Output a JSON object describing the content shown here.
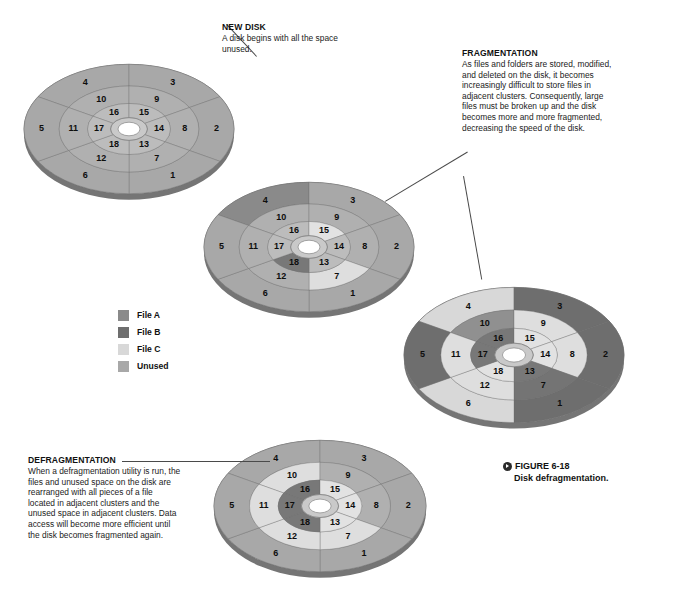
{
  "figure": {
    "caption_label": "FIGURE 6-18",
    "caption_title": "Disk defragmentation.",
    "caption_icon": "play-circle-icon"
  },
  "annotations": [
    {
      "id": "new-disk",
      "heading": "NEW DISK",
      "body": "A disk begins with all the space unused."
    },
    {
      "id": "fragmentation",
      "heading": "FRAGMENTATION",
      "body": "As files and folders are stored, modified, and deleted on the disk, it becomes increasingly difficult to store files in adjacent clusters. Consequently, large files must be broken up and the disk becomes more and more fragmented, decreasing the speed of the disk."
    },
    {
      "id": "defragmentation",
      "heading": "DEFRAGMENTATION",
      "body": "When a defragmentation utility is run, the files and unused space on the disk are rearranged with all pieces of a file located in adjacent clusters and the unused space in adjacent clusters. Data access will become more efficient until the disk becomes fragmented again."
    }
  ],
  "legend": {
    "items": [
      {
        "label": "File A",
        "color": "#8a8a8a"
      },
      {
        "label": "File B",
        "color": "#6e6e6e"
      },
      {
        "label": "File C",
        "color": "#d8d8d8"
      },
      {
        "label": "Unused",
        "color": "#a8a8a8"
      }
    ]
  },
  "colors": {
    "file_a": "#8a8a8a",
    "file_b": "#6e6e6e",
    "file_c": "#d8d8d8",
    "unused": "#a8a8a8",
    "unused_mid": "#b0b0b0",
    "unused_light": "#bcbcbc",
    "edge": "#9a9a9a",
    "rim": "#8f8f8f",
    "hub_outer": "#c9c9c9",
    "hub_inner": "#ffffff",
    "divider": "#6d6d6d",
    "leader": "#4a4a4a"
  },
  "disk_geometry": {
    "sector_count": 6,
    "ring_count": 3,
    "cluster_numbers": [
      1,
      2,
      3,
      4,
      5,
      6,
      7,
      8,
      9,
      10,
      11,
      12,
      13,
      14,
      15,
      16,
      17,
      18
    ],
    "ring_outer_numbers": [
      1,
      2,
      3,
      4,
      5,
      6
    ],
    "ring_middle_numbers": [
      7,
      8,
      9,
      10,
      11,
      12
    ],
    "ring_inner_numbers": [
      13,
      14,
      15,
      16,
      17,
      18
    ]
  },
  "disks": [
    {
      "id": "disk-new",
      "title": "New disk - all space unused",
      "allocation": {
        "1": "unused",
        "2": "unused",
        "3": "unused",
        "4": "unused",
        "5": "unused",
        "6": "unused",
        "7": "unused",
        "8": "unused",
        "9": "unused",
        "10": "unused",
        "11": "unused",
        "12": "unused",
        "13": "unused",
        "14": "unused",
        "15": "unused",
        "16": "unused",
        "17": "unused",
        "18": "unused"
      }
    },
    {
      "id": "disk-stored",
      "title": "Disk with files stored",
      "allocation": {
        "1": "unused",
        "2": "unused",
        "3": "unused",
        "4": "file_a",
        "5": "unused",
        "6": "unused",
        "7": "file_c",
        "8": "unused",
        "9": "unused",
        "10": "unused",
        "11": "unused",
        "12": "unused",
        "13": "unused",
        "14": "unused",
        "15": "file_c",
        "16": "unused",
        "17": "unused",
        "18": "file_b"
      }
    },
    {
      "id": "disk-fragmented",
      "title": "Fragmented disk",
      "allocation": {
        "1": "file_b",
        "2": "file_b",
        "3": "file_b",
        "4": "file_c",
        "5": "file_b",
        "6": "file_c",
        "7": "file_b",
        "8": "file_c",
        "9": "file_c",
        "10": "file_a",
        "11": "file_c",
        "12": "file_c",
        "13": "file_b",
        "14": "file_c",
        "15": "file_c",
        "16": "file_b",
        "17": "file_b",
        "18": "file_c"
      }
    },
    {
      "id": "disk-defragmented",
      "title": "Defragmented disk",
      "allocation": {
        "1": "unused",
        "2": "unused",
        "3": "unused",
        "4": "unused",
        "5": "unused",
        "6": "unused",
        "7": "file_c",
        "8": "unused",
        "9": "unused",
        "10": "file_c",
        "11": "file_c",
        "12": "file_c",
        "13": "file_c",
        "14": "file_c",
        "15": "file_c",
        "16": "file_b",
        "17": "file_b",
        "18": "file_b"
      }
    }
  ]
}
